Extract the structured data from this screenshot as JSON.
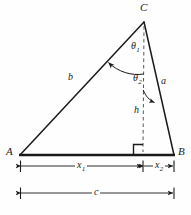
{
  "figure": {
    "background_color": "#fefefe",
    "stroke_color": "#1a1a1a",
    "vertices": {
      "A": {
        "label": "A",
        "x": 20,
        "y": 155
      },
      "B": {
        "label": "B",
        "x": 174,
        "y": 155
      },
      "C": {
        "label": "C",
        "x": 144,
        "y": 22
      }
    },
    "foot_of_altitude": {
      "x": 143,
      "y": 155
    },
    "sides": {
      "b": {
        "label": "b",
        "from": "A",
        "to": "C"
      },
      "a": {
        "label": "a",
        "from": "C",
        "to": "B"
      },
      "c": {
        "label": "c",
        "from": "A",
        "to": "B"
      }
    },
    "altitude": {
      "label": "h",
      "style": "dashed",
      "from": "C",
      "to": "foot_of_altitude"
    },
    "angles": [
      {
        "name": "theta-1",
        "label": "θ",
        "subscript": "1",
        "at": "C",
        "between": [
          "altitude",
          "b"
        ]
      },
      {
        "name": "theta-2",
        "label": "θ",
        "subscript": "2",
        "at": "C",
        "between": [
          "altitude",
          "a"
        ]
      }
    ],
    "right_angle_marker": {
      "at": "foot_of_altitude",
      "size": 9
    },
    "dimensions": [
      {
        "name": "x1",
        "label": "x",
        "subscript": "1",
        "from_x": 20,
        "to_x": 143,
        "y": 166
      },
      {
        "name": "x2",
        "label": "x",
        "subscript": "2",
        "from_x": 143,
        "to_x": 174,
        "y": 166
      },
      {
        "name": "c",
        "label": "c",
        "subscript": "",
        "from_x": 20,
        "to_x": 174,
        "y": 193
      }
    ]
  }
}
